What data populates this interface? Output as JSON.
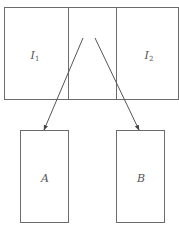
{
  "diagram": {
    "top_container": {
      "regions": [
        {
          "id": "I1",
          "label": "I",
          "subscript": "1"
        },
        {
          "id": "middle",
          "label": ""
        },
        {
          "id": "I2",
          "label": "I",
          "subscript": "2"
        }
      ]
    },
    "bottom_boxes": [
      {
        "id": "A",
        "label": "A"
      },
      {
        "id": "B",
        "label": "B"
      }
    ],
    "arrows": [
      {
        "from": "middle",
        "to": "A"
      },
      {
        "from": "middle",
        "to": "B"
      }
    ],
    "colors": {
      "stroke": "#6b6b6b",
      "text": "#555555",
      "background": "#ffffff"
    }
  }
}
